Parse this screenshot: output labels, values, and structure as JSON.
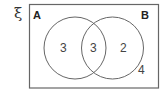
{
  "diagram": {
    "type": "venn",
    "universal_symbol": "ξ",
    "sets": [
      {
        "label": "A"
      },
      {
        "label": "B"
      }
    ],
    "regions": {
      "a_only": "3",
      "a_and_b": "3",
      "b_only": "2",
      "outside": "4"
    },
    "colors": {
      "stroke": "#555555",
      "text": "#333333"
    }
  }
}
